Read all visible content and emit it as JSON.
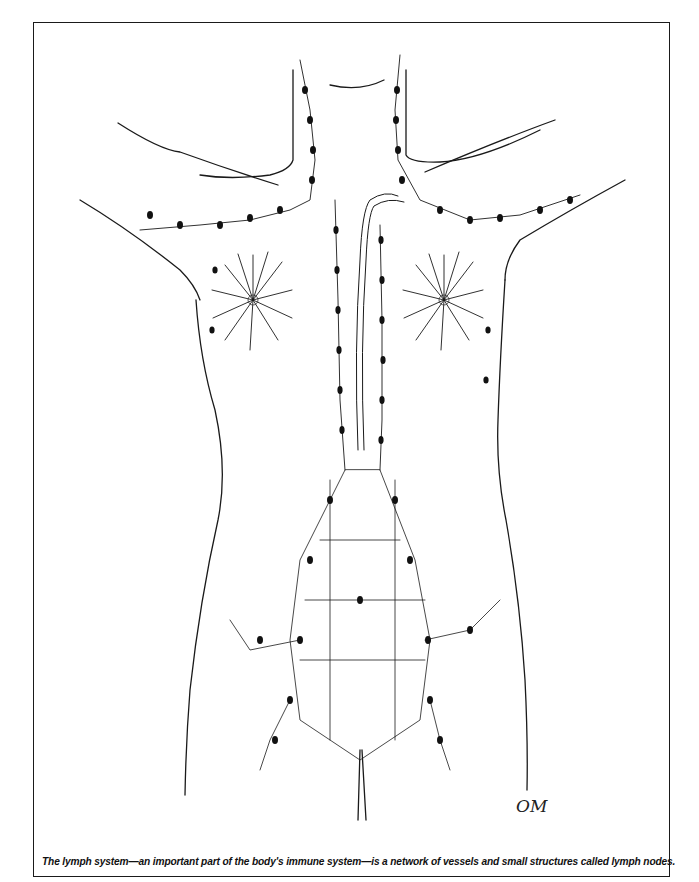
{
  "figure": {
    "caption": "The lymph system—an important part of the body's immune system—is a network of vessels and small structures called lymph nodes.",
    "signature": "OM",
    "colors": {
      "line": "#1a1a1a",
      "node": "#111111",
      "background": "#ffffff"
    }
  }
}
